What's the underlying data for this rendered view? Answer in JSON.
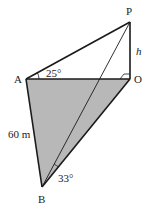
{
  "diagram": {
    "points": {
      "P": {
        "label": "P",
        "x": 130,
        "y": 22
      },
      "O": {
        "label": "O",
        "x": 130,
        "y": 79
      },
      "A": {
        "label": "A",
        "x": 26,
        "y": 79
      },
      "B": {
        "label": "B",
        "x": 42,
        "y": 187
      }
    },
    "labels": {
      "height": "h",
      "angle_A": "25°",
      "angle_B": "33°",
      "side_AB": "60 m"
    },
    "colors": {
      "shaded_triangle": "#b8b8b8",
      "lines": "#1a1a1a"
    }
  }
}
